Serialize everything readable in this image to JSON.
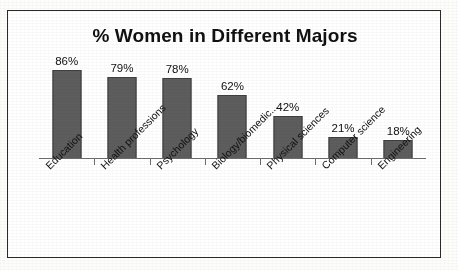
{
  "chart_data": {
    "type": "bar",
    "title": "% Women in Different Majors",
    "xlabel": "",
    "ylabel": "",
    "ylim": [
      0,
      100
    ],
    "grid": false,
    "legend": false,
    "value_suffix": "%",
    "categories": [
      "Education",
      "Health professions",
      "Psychology",
      "Biology/biomedic...",
      "Physical sciences",
      "Computer science",
      "Engineering"
    ],
    "values": [
      86,
      79,
      78,
      62,
      42,
      21,
      18
    ],
    "data_labels": [
      "86%",
      "79%",
      "78%",
      "62%",
      "42%",
      "21%",
      "18%"
    ],
    "colors": {
      "bar_fill": "#5d5d5d",
      "bar_stroke": "#3f3f3f",
      "axis": "#6d6d6d",
      "text": "#111111",
      "frame": "#2a2a2a",
      "background": "#ffffff"
    }
  }
}
